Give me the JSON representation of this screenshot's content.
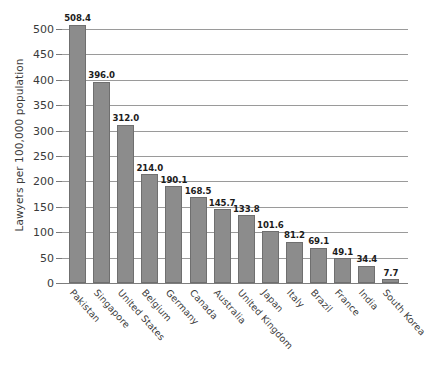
{
  "chart_data": {
    "type": "bar",
    "title": "",
    "xlabel": "",
    "ylabel": "Lawyers per 100,000 population",
    "ylim": [
      0,
      500
    ],
    "ytick_step": 50,
    "yticks": [
      0,
      50,
      100,
      150,
      200,
      250,
      300,
      350,
      400,
      450,
      500
    ],
    "grid": true,
    "legend": false,
    "bar_color": "#8c8c8c",
    "bar_edge_color": "#6f6f6f",
    "grid_color": "#9a9a9a",
    "axis_color": "#7d7d7d",
    "text_color": "#3a3a3a",
    "value_label_format": "one-decimal",
    "categories": [
      "Pakistan",
      "Singapore",
      "United States",
      "Belgium",
      "Germany",
      "Canada",
      "Australia",
      "United Kingdom",
      "Japan",
      "Italy",
      "Brazil",
      "France",
      "India",
      "South Korea"
    ],
    "values": [
      508.4,
      396.0,
      312.0,
      214.0,
      190.1,
      168.5,
      145.7,
      133.8,
      101.6,
      81.2,
      69.1,
      49.1,
      34.4,
      7.7
    ],
    "value_labels": [
      "508.4",
      "396.0",
      "312.0",
      "214.0",
      "190.1",
      "168.5",
      "145.7",
      "133.8",
      "101.6",
      "81.2",
      "69.1",
      "49.1",
      "34.4",
      "7.7"
    ]
  }
}
